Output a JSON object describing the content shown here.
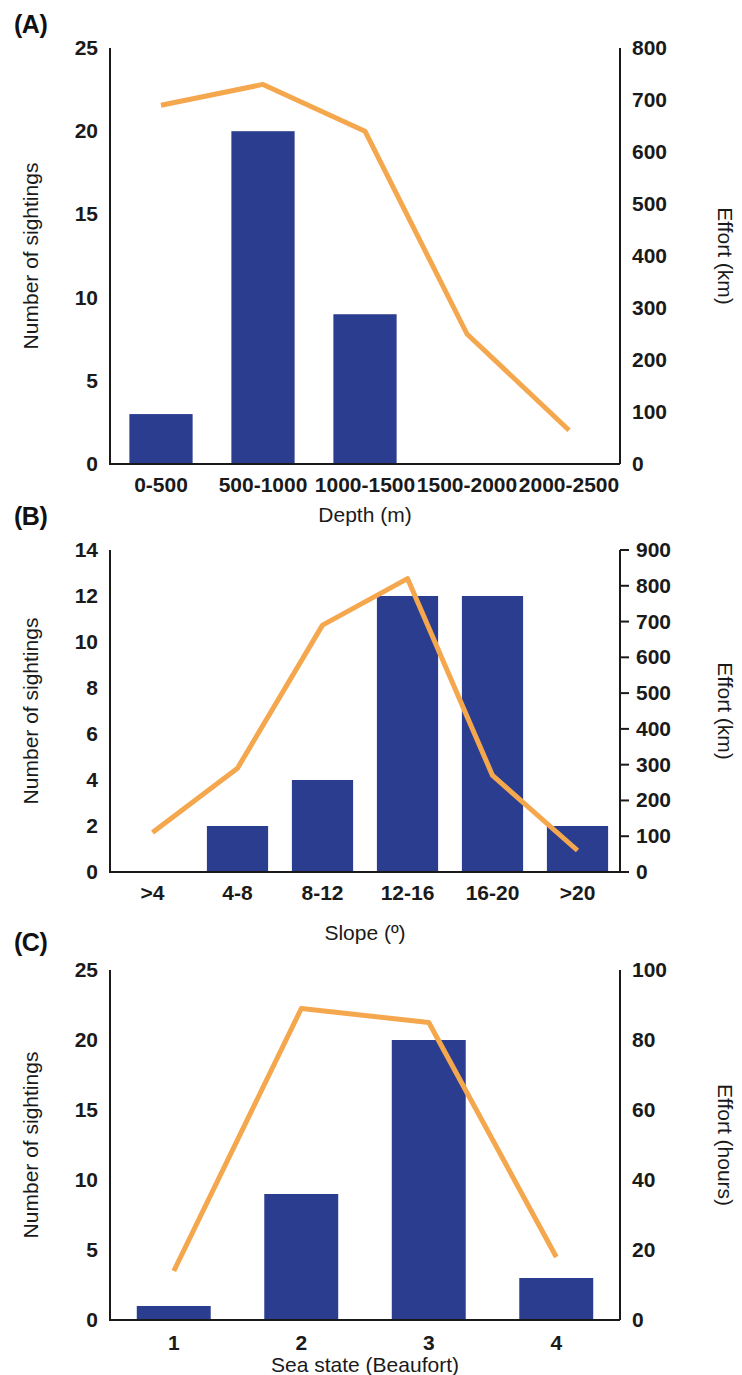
{
  "figure": {
    "panels": [
      {
        "id": "A",
        "letter": "(A)",
        "xlabel": "Depth (m)",
        "ylabel_left": "Number of sightings",
        "ylabel_right": "Effort (km)",
        "categories": [
          "0-500",
          "500-1000",
          "1000-1500",
          "1500-2000",
          "2000-2500"
        ],
        "bar_values": [
          3,
          20,
          9,
          0,
          0
        ],
        "line_values": [
          690,
          730,
          640,
          250,
          65
        ],
        "left_ticks": [
          0,
          5,
          10,
          15,
          20,
          25
        ],
        "right_ticks": [
          0,
          100,
          200,
          300,
          400,
          500,
          600,
          700,
          800
        ],
        "ylim_left": [
          0,
          25
        ],
        "ylim_right": [
          0,
          800
        ],
        "right_axis_has_ticks": false
      },
      {
        "id": "B",
        "letter": "(B)",
        "xlabel": "Slope (º)",
        "ylabel_left": "Number of sightings",
        "ylabel_right": "Effort (km)",
        "categories": [
          ">4",
          "4-8",
          "8-12",
          "12-16",
          "16-20",
          ">20"
        ],
        "bar_values": [
          0,
          2,
          4,
          12,
          12,
          2
        ],
        "line_values": [
          110,
          290,
          690,
          820,
          270,
          60
        ],
        "left_ticks": [
          0,
          2,
          4,
          6,
          8,
          10,
          12,
          14
        ],
        "right_ticks": [
          0,
          100,
          200,
          300,
          400,
          500,
          600,
          700,
          800,
          900
        ],
        "ylim_left": [
          0,
          14
        ],
        "ylim_right": [
          0,
          900
        ],
        "right_axis_has_ticks": true
      },
      {
        "id": "C",
        "letter": "(C)",
        "xlabel": "Sea state (Beaufort)",
        "ylabel_left": "Number of sightings",
        "ylabel_right": "Effort (hours)",
        "categories": [
          "1",
          "2",
          "3",
          "4"
        ],
        "bar_values": [
          1,
          9,
          20,
          3
        ],
        "line_values": [
          14,
          89,
          85,
          18
        ],
        "left_ticks": [
          0,
          5,
          10,
          15,
          20,
          25
        ],
        "right_ticks": [
          0,
          20,
          40,
          60,
          80,
          100
        ],
        "ylim_left": [
          0,
          25
        ],
        "ylim_right": [
          0,
          100
        ],
        "right_axis_has_ticks": false
      }
    ],
    "colors": {
      "bar": "#2a3d8f",
      "line": "#f5a74e",
      "axis": "#1a1a1a",
      "text": "#1a1a1a",
      "background": "#ffffff"
    }
  },
  "chart_data": [
    {
      "type": "bar",
      "panel": "A",
      "title": "(A)",
      "xlabel": "Depth (m)",
      "ylabel": "Number of sightings",
      "ylabel_secondary": "Effort (km)",
      "categories": [
        "0-500",
        "500-1000",
        "1000-1500",
        "1500-2000",
        "2000-2500"
      ],
      "values": [
        3,
        20,
        9,
        0,
        0
      ],
      "series": [
        {
          "name": "Number of sightings",
          "type": "bar",
          "axis": "left",
          "values": [
            3,
            20,
            9,
            0,
            0
          ]
        },
        {
          "name": "Effort (km)",
          "type": "line",
          "axis": "right",
          "values": [
            690,
            730,
            640,
            250,
            65
          ]
        }
      ],
      "ylim": [
        0,
        25
      ],
      "ylim_secondary": [
        0,
        800
      ],
      "yticks": [
        0,
        5,
        10,
        15,
        20,
        25
      ],
      "yticks_secondary": [
        0,
        100,
        200,
        300,
        400,
        500,
        600,
        700,
        800
      ],
      "grid": false,
      "legend": "none"
    },
    {
      "type": "bar",
      "panel": "B",
      "title": "(B)",
      "xlabel": "Slope (º)",
      "ylabel": "Number of sightings",
      "ylabel_secondary": "Effort (km)",
      "categories": [
        ">4",
        "4-8",
        "8-12",
        "12-16",
        "16-20",
        ">20"
      ],
      "values": [
        0,
        2,
        4,
        12,
        12,
        2
      ],
      "series": [
        {
          "name": "Number of sightings",
          "type": "bar",
          "axis": "left",
          "values": [
            0,
            2,
            4,
            12,
            12,
            2
          ]
        },
        {
          "name": "Effort (km)",
          "type": "line",
          "axis": "right",
          "values": [
            110,
            290,
            690,
            820,
            270,
            60
          ]
        }
      ],
      "ylim": [
        0,
        14
      ],
      "ylim_secondary": [
        0,
        900
      ],
      "yticks": [
        0,
        2,
        4,
        6,
        8,
        10,
        12,
        14
      ],
      "yticks_secondary": [
        0,
        100,
        200,
        300,
        400,
        500,
        600,
        700,
        800,
        900
      ],
      "grid": false,
      "legend": "none"
    },
    {
      "type": "bar",
      "panel": "C",
      "title": "(C)",
      "xlabel": "Sea state (Beaufort)",
      "ylabel": "Number of sightings",
      "ylabel_secondary": "Effort (hours)",
      "categories": [
        "1",
        "2",
        "3",
        "4"
      ],
      "values": [
        1,
        9,
        20,
        3
      ],
      "series": [
        {
          "name": "Number of sightings",
          "type": "bar",
          "axis": "left",
          "values": [
            1,
            9,
            20,
            3
          ]
        },
        {
          "name": "Effort (hours)",
          "type": "line",
          "axis": "right",
          "values": [
            14,
            89,
            85,
            18
          ]
        }
      ],
      "ylim": [
        0,
        25
      ],
      "ylim_secondary": [
        0,
        100
      ],
      "yticks": [
        0,
        5,
        10,
        15,
        20,
        25
      ],
      "yticks_secondary": [
        0,
        20,
        40,
        60,
        80,
        100
      ],
      "grid": false,
      "legend": "none"
    }
  ]
}
